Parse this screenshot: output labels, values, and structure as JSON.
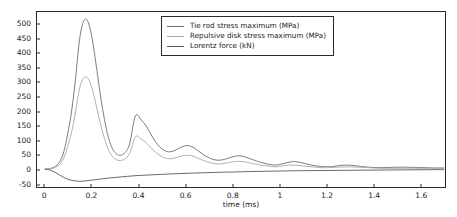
{
  "chart_data": {
    "type": "line",
    "title": "",
    "xlabel": "time (ms)",
    "ylabel": "",
    "xlim": [
      -0.035,
      1.705
    ],
    "ylim": [
      -62,
      545
    ],
    "grid": false,
    "legend_position": "top-center-right",
    "xticks": [
      0,
      0.2,
      0.4,
      0.6,
      0.8,
      1,
      1.2,
      1.4,
      1.6
    ],
    "xtick_labels": [
      "0",
      "0.2",
      "0.4",
      "0.6",
      "0.8",
      "1",
      "1.2",
      "1.4",
      "1.6"
    ],
    "yticks": [
      -50,
      0,
      50,
      100,
      150,
      200,
      250,
      300,
      350,
      400,
      450,
      500
    ],
    "ytick_labels": [
      "-50",
      "0",
      "50",
      "100",
      "150",
      "200",
      "250",
      "300",
      "350",
      "400",
      "450",
      "500"
    ],
    "series": [
      {
        "name": "Tie rod stress maximum (MPa)",
        "color": "#6d6d70",
        "x": [
          0,
          0.02,
          0.04,
          0.06,
          0.08,
          0.1,
          0.115,
          0.13,
          0.145,
          0.16,
          0.175,
          0.19,
          0.205,
          0.22,
          0.24,
          0.26,
          0.275,
          0.29,
          0.305,
          0.32,
          0.34,
          0.36,
          0.385,
          0.41,
          0.43,
          0.45,
          0.47,
          0.49,
          0.51,
          0.525,
          0.545,
          0.565,
          0.585,
          0.605,
          0.625,
          0.645,
          0.665,
          0.685,
          0.705,
          0.725,
          0.745,
          0.765,
          0.785,
          0.805,
          0.825,
          0.845,
          0.865,
          0.885,
          0.905,
          0.925,
          0.945,
          0.965,
          0.985,
          1.005,
          1.025,
          1.045,
          1.065,
          1.085,
          1.105,
          1.125,
          1.15,
          1.175,
          1.2,
          1.225,
          1.26,
          1.29,
          1.32,
          1.35,
          1.39,
          1.43,
          1.47,
          1.52,
          1.57,
          1.62,
          1.67,
          1.7
        ],
        "y": [
          0,
          2,
          8,
          24,
          62,
          140,
          215,
          320,
          440,
          505,
          520,
          492,
          430,
          345,
          232,
          142,
          95,
          66,
          52,
          48,
          57,
          88,
          185,
          170,
          150,
          122,
          95,
          76,
          64,
          60,
          62,
          70,
          78,
          82,
          78,
          68,
          56,
          45,
          37,
          32,
          31,
          34,
          39,
          44,
          46,
          44,
          39,
          33,
          27,
          22,
          18,
          15,
          14,
          17,
          21,
          25,
          26,
          24,
          20,
          16,
          12,
          9,
          8,
          9,
          13,
          14,
          12,
          9,
          6,
          5,
          6,
          7,
          6,
          5,
          4,
          4
        ]
      },
      {
        "name": "Repulsive disk stress maximum (MPa)",
        "color": "#a8a8ab",
        "x": [
          0,
          0.02,
          0.04,
          0.06,
          0.08,
          0.1,
          0.115,
          0.13,
          0.145,
          0.16,
          0.175,
          0.19,
          0.205,
          0.22,
          0.24,
          0.26,
          0.275,
          0.29,
          0.305,
          0.32,
          0.34,
          0.36,
          0.385,
          0.41,
          0.43,
          0.45,
          0.47,
          0.49,
          0.51,
          0.525,
          0.545,
          0.565,
          0.585,
          0.605,
          0.625,
          0.645,
          0.665,
          0.685,
          0.705,
          0.725,
          0.745,
          0.765,
          0.785,
          0.805,
          0.825,
          0.845,
          0.865,
          0.885,
          0.905,
          0.925,
          0.945,
          0.965,
          0.985,
          1.005,
          1.025,
          1.05,
          1.075,
          1.1,
          1.125,
          1.15,
          1.18,
          1.21,
          1.25,
          1.29,
          1.33,
          1.38,
          1.43,
          1.49,
          1.55,
          1.62,
          1.67,
          1.7
        ],
        "y": [
          0,
          1,
          5,
          15,
          40,
          90,
          137,
          202,
          275,
          312,
          320,
          303,
          265,
          212,
          143,
          88,
          58,
          41,
          32,
          30,
          35,
          55,
          112,
          104,
          92,
          75,
          59,
          47,
          39,
          36,
          37,
          42,
          46,
          48,
          46,
          40,
          33,
          27,
          22,
          19,
          18,
          20,
          23,
          26,
          27,
          26,
          23,
          19,
          16,
          13,
          11,
          9,
          8,
          10,
          13,
          14,
          13,
          11,
          9,
          7,
          5,
          5,
          7,
          8,
          7,
          5,
          3,
          3,
          3,
          3,
          2,
          2
        ]
      },
      {
        "name": "Lorentz force (kN)",
        "color": "#57575a",
        "x": [
          0,
          0.02,
          0.04,
          0.06,
          0.08,
          0.1,
          0.12,
          0.135,
          0.15,
          0.17,
          0.19,
          0.21,
          0.24,
          0.27,
          0.31,
          0.35,
          0.4,
          0.45,
          0.5,
          0.56,
          0.62,
          0.68,
          0.74,
          0.8,
          0.87,
          0.94,
          1.01,
          1.08,
          1.15,
          1.22,
          1.3,
          1.38,
          1.46,
          1.54,
          1.62,
          1.7
        ],
        "y": [
          0,
          -3,
          -10,
          -20,
          -29,
          -36,
          -40,
          -41.5,
          -42,
          -41,
          -39,
          -37,
          -34,
          -31,
          -28,
          -25,
          -22,
          -20,
          -18,
          -16,
          -14,
          -12.5,
          -11,
          -10,
          -8.5,
          -7.5,
          -6.5,
          -5.5,
          -5,
          -4.5,
          -4,
          -3.5,
          -3,
          -2.5,
          -2,
          -1.8
        ]
      }
    ]
  },
  "legend": {
    "entries": [
      {
        "label": "Tie rod stress maximum (MPa)"
      },
      {
        "label": "Repulsive disk stress maximum (MPa)"
      },
      {
        "label": "Lorentz force (kN)"
      }
    ]
  }
}
